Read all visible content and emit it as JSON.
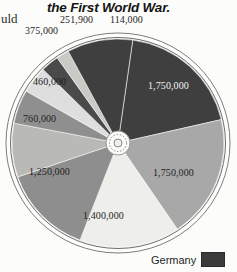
{
  "header": {
    "left_text_fragment": "uld",
    "title": "the First World War."
  },
  "legend": {
    "entries": [
      {
        "label": "Germany",
        "color": "#3b3b3b"
      }
    ]
  },
  "chart_data": {
    "type": "pie",
    "title": "the First World War.",
    "units": "military deaths",
    "legend_position": "bottom-right",
    "grid": false,
    "labels_visible": [
      "114,000",
      "251,900",
      "375,000",
      "460,000",
      "760,000",
      "1,250,000",
      "1,400,000",
      "1,750,000",
      "1,750,000"
    ],
    "categories": [
      "Germany",
      "slice-1750000-right",
      "slice-1400000",
      "slice-1250000",
      "slice-760000",
      "slice-460000",
      "slice-375000",
      "slice-251900",
      "slice-114000"
    ],
    "values": [
      1750000,
      1750000,
      1400000,
      1250000,
      760000,
      460000,
      375000,
      251900,
      114000
    ],
    "value_labels": [
      "1,750,000",
      "1,750,000",
      "1,400,000",
      "1,250,000",
      "760,000",
      "460,000",
      "375,000",
      "251,900",
      "114,000"
    ],
    "colors": [
      "#3f3f3f",
      "#a8a8a8",
      "#eeeeea",
      "#8e8e8e",
      "#b9b9b6",
      "#8f8f8f",
      "#dedede",
      "#4a4a4a",
      "#c9c9c6"
    ],
    "total": 9110900
  },
  "slices": [
    {
      "name": "germany",
      "value_label": "1,750,000",
      "color": "#3f3f3f",
      "start": 8,
      "end": 77,
      "label_x": 148,
      "label_y": 80,
      "label_class": "on-dark"
    },
    {
      "name": "right-grey",
      "value_label": "1,750,000",
      "color": "#a8a8a8",
      "start": 77,
      "end": 146,
      "label_x": 153,
      "label_y": 167,
      "label_class": "outside"
    },
    {
      "name": "bottom-pale",
      "value_label": "1,400,000",
      "color": "#eeeeea",
      "start": 146,
      "end": 201,
      "label_x": 83,
      "label_y": 210,
      "label_class": "outside"
    },
    {
      "name": "lower-left",
      "value_label": "1,250,000",
      "color": "#8e8e8e",
      "start": 201,
      "end": 251,
      "label_x": 29,
      "label_y": 166,
      "label_class": "outside"
    },
    {
      "name": "mid-left",
      "value_label": "760,000",
      "color": "#b9b9b6",
      "start": 251,
      "end": 281,
      "label_x": 23,
      "label_y": 113,
      "label_class": "outside"
    },
    {
      "name": "upper-left",
      "value_label": "460,000",
      "color": "#8f8f8f",
      "start": 281,
      "end": 300,
      "label_x": 33,
      "label_y": 76,
      "label_class": "outside"
    },
    {
      "name": "pale-wedge",
      "value_label": "375,000",
      "color": "#dedede",
      "start": 300,
      "end": 315,
      "label_x": 25,
      "label_y": 25,
      "label_class": "outside"
    },
    {
      "name": "dark-wedge",
      "value_label": "251,900",
      "color": "#4a4a4a",
      "start": 315,
      "end": 325,
      "label_x": 60,
      "label_y": 14,
      "label_class": "outside"
    },
    {
      "name": "light-wedge",
      "value_label": "114,000",
      "color": "#c9c9c6",
      "start": 325,
      "end": 332,
      "label_x": 110,
      "label_y": 14,
      "label_class": "outside"
    },
    {
      "name": "last-dark",
      "value_label": "",
      "color": "#3f3f3f",
      "start": 332,
      "end": 368,
      "label_x": 0,
      "label_y": 0,
      "label_class": "outside"
    }
  ]
}
